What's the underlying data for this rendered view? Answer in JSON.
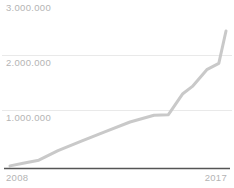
{
  "chart_data": {
    "type": "line",
    "title": "",
    "subtitle": "",
    "xlabel": "",
    "ylabel": "",
    "xlim": [
      2008,
      2017
    ],
    "ylim": [
      0,
      3000000
    ],
    "grid": true,
    "gridlines": [
      1000000,
      2000000
    ],
    "legend": "none",
    "y_tick_labels": [
      "1.000.000",
      "2.000.000",
      "3.000.000"
    ],
    "y_ticks": [
      1000000,
      2000000,
      3000000
    ],
    "x_tick_labels": [
      "2008",
      "2017"
    ],
    "x_ticks": [
      2008,
      2017
    ],
    "number_format": "dot-thousands-separator",
    "series": [
      {
        "name": "series-1",
        "color": "#c9c9c9",
        "x": [
          2008,
          2008.6,
          2009.2,
          2010.0,
          2011.0,
          2012.0,
          2013.0,
          2014.0,
          2014.6,
          2015.2,
          2015.6,
          2016.2,
          2016.7,
          2017.0
        ],
        "values": [
          40000,
          95000,
          150000,
          330000,
          520000,
          700000,
          880000,
          1010000,
          1020000,
          1420000,
          1560000,
          1880000,
          2000000,
          2620000
        ]
      }
    ]
  },
  "axes": {
    "y_labels": {
      "top": "3.000.000",
      "middle": "2.000.000",
      "bottom": "1.000.000"
    },
    "x_labels": {
      "start": "2008",
      "end": "2017"
    }
  },
  "colors": {
    "line": "#c9c9c9",
    "gridline": "#e9e9e9",
    "axis": "#555555",
    "tick_text": "#b4b4b4",
    "background": "#ffffff"
  }
}
